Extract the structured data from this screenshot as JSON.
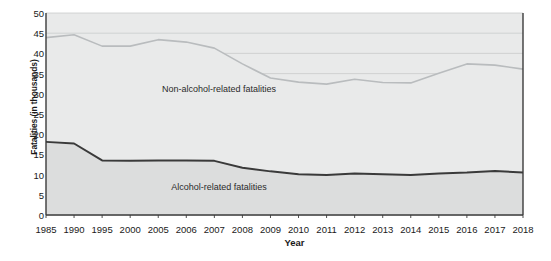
{
  "chart_data": {
    "type": "area",
    "title": "",
    "xlabel": "Year",
    "ylabel": "Fatalities (in thousands)",
    "ylim": [
      0,
      50
    ],
    "ytick_step": 5,
    "grid": true,
    "legend_position": "inline-labels",
    "categories": [
      "1985",
      "1990",
      "1995",
      "2000",
      "2005",
      "2006",
      "2007",
      "2008",
      "2009",
      "2010",
      "2011",
      "2012",
      "2013",
      "2014",
      "2015",
      "2016",
      "2017",
      "2018"
    ],
    "yticks": [
      "0",
      "5",
      "10",
      "15",
      "20",
      "25",
      "30",
      "35",
      "40",
      "45",
      "50"
    ],
    "series": [
      {
        "name": "Non-alcohol-related fatalities",
        "color": "#b9bcbe",
        "fill": "#e9eaea",
        "values": [
          43.9,
          44.6,
          41.8,
          41.8,
          43.4,
          42.8,
          41.3,
          37.4,
          33.9,
          32.9,
          32.4,
          33.6,
          32.8,
          32.7,
          35.1,
          37.4,
          37.1,
          36.1
        ]
      },
      {
        "name": "Alcohol-related fatalities",
        "color": "#3a3a3a",
        "fill": "#dcdddd",
        "values": [
          18.1,
          17.7,
          13.5,
          13.4,
          13.5,
          13.5,
          13.4,
          11.7,
          10.8,
          10.1,
          9.9,
          10.3,
          10.1,
          9.9,
          10.3,
          10.5,
          10.9,
          10.5
        ]
      }
    ],
    "series_labels": [
      {
        "text": "Non-alcohol-related fatalities",
        "x": 219,
        "y": 89
      },
      {
        "text": "Alcohol-related fatalities",
        "x": 219,
        "y": 187
      }
    ]
  },
  "plot": {
    "left": 46,
    "right": 523,
    "top": 13,
    "bottom": 215,
    "background": "#e9eaea",
    "grid_color": "#c9cbcc",
    "axis_color": "#3b3b3b"
  }
}
